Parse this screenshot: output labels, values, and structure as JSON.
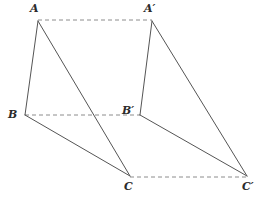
{
  "figure": {
    "width": 264,
    "height": 199,
    "background_color": "#ffffff",
    "solid_line_color": "#555555",
    "dashed_line_color": "#8c8c8c",
    "label_color": "#2b2b2b",
    "solid_line_width": 1,
    "dashed_line_width": 1,
    "dash_pattern": "4,3"
  },
  "vertices": [
    {
      "id": "A",
      "label": "A",
      "x": 38,
      "y": 21,
      "label_x": 30,
      "label_y": 3
    },
    {
      "id": "B",
      "label": "B",
      "x": 25,
      "y": 115,
      "label_x": 8,
      "label_y": 109
    },
    {
      "id": "C",
      "label": "C",
      "x": 130,
      "y": 176,
      "label_x": 124,
      "label_y": 181
    },
    {
      "id": "Ap",
      "label": "A′",
      "x": 152,
      "y": 21,
      "label_x": 144,
      "label_y": 3
    },
    {
      "id": "Bp",
      "label": "B′",
      "x": 140,
      "y": 115,
      "label_x": 122,
      "label_y": 105
    },
    {
      "id": "Cp",
      "label": "C′",
      "x": 247,
      "y": 176,
      "label_x": 242,
      "label_y": 181
    }
  ],
  "solid_edges": [
    {
      "name": "edge-A-B",
      "from": "A",
      "to": "B",
      "x1": 38,
      "y1": 21,
      "x2": 25,
      "y2": 115
    },
    {
      "name": "edge-B-C",
      "from": "B",
      "to": "C",
      "x1": 25,
      "y1": 115,
      "x2": 130,
      "y2": 176
    },
    {
      "name": "edge-A-C",
      "from": "A",
      "to": "C",
      "x1": 38,
      "y1": 21,
      "x2": 130,
      "y2": 176
    },
    {
      "name": "edge-Ap-Bp",
      "from": "Ap",
      "to": "Bp",
      "x1": 152,
      "y1": 21,
      "x2": 140,
      "y2": 115
    },
    {
      "name": "edge-Bp-Cp",
      "from": "Bp",
      "to": "Cp",
      "x1": 140,
      "y1": 115,
      "x2": 247,
      "y2": 176
    },
    {
      "name": "edge-Ap-Cp",
      "from": "Ap",
      "to": "Cp",
      "x1": 152,
      "y1": 21,
      "x2": 247,
      "y2": 176
    }
  ],
  "dashed_edges": [
    {
      "name": "translation-line-A-Ap",
      "from": "A",
      "to": "Ap",
      "x1": 38,
      "y1": 20,
      "x2": 152,
      "y2": 20
    },
    {
      "name": "translation-line-B-Bp",
      "from": "B",
      "to": "Bp",
      "x1": 25,
      "y1": 115,
      "x2": 140,
      "y2": 115
    },
    {
      "name": "translation-line-C-Cp",
      "from": "C",
      "to": "Cp",
      "x1": 130,
      "y1": 177,
      "x2": 247,
      "y2": 177
    }
  ]
}
